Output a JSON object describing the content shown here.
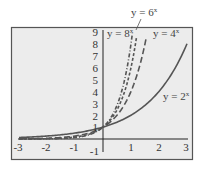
{
  "chart_data": {
    "type": "line",
    "title": "",
    "xlabel": "",
    "ylabel": "",
    "xlim": [
      -3,
      3
    ],
    "ylim": [
      -1,
      9
    ],
    "x_ticks": [
      "-3",
      "-2",
      "-1",
      "1",
      "2",
      "3"
    ],
    "y_ticks": [
      "-1",
      "1",
      "2",
      "3",
      "4",
      "5",
      "6",
      "7",
      "8",
      "9"
    ],
    "grid": false,
    "series": [
      {
        "name": "y = 2^x",
        "label": "y = 2",
        "exp": "x",
        "base": 2,
        "style": "solid",
        "x": [
          -3,
          -2,
          -1,
          0,
          1,
          2,
          3
        ],
        "values": [
          0.125,
          0.25,
          0.5,
          1,
          2,
          4,
          8
        ]
      },
      {
        "name": "y = 4^x",
        "label": "y = 4",
        "exp": "x",
        "base": 4,
        "style": "long-dash",
        "x": [
          -3,
          -2,
          -1,
          0,
          1,
          1.58
        ],
        "values": [
          0.016,
          0.063,
          0.25,
          1,
          4,
          9
        ]
      },
      {
        "name": "y = 6^x",
        "label": "y = 6",
        "exp": "x",
        "base": 6,
        "style": "short-dash",
        "x": [
          -3,
          -2,
          -1,
          0,
          1,
          1.23
        ],
        "values": [
          0.005,
          0.028,
          0.167,
          1,
          6,
          9
        ]
      },
      {
        "name": "y = 8^x",
        "label": "y = 8",
        "exp": "x",
        "base": 8,
        "style": "dash-dot",
        "x": [
          -3,
          -2,
          -1,
          0,
          1,
          1.06
        ],
        "values": [
          0.002,
          0.016,
          0.125,
          1,
          8,
          9
        ]
      }
    ],
    "annotations": [
      {
        "text": "y = 6^x",
        "position": "above plot, arrow pointing to curve"
      },
      {
        "text": "y = 8^x",
        "position": "top, left of curves"
      },
      {
        "text": "y = 4^x",
        "position": "top, right of curves"
      },
      {
        "text": "y = 2^x",
        "position": "right side, near curve"
      }
    ]
  },
  "colors": {
    "background": "#ffffff",
    "plot_background": "#ececec",
    "frame": "#555555",
    "curve": "#555555",
    "axis": "#222222"
  }
}
